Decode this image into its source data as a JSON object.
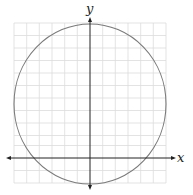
{
  "figure": {
    "type": "coordinate-plane-with-circle",
    "axes": {
      "x_label": "x",
      "y_label": "y",
      "arrows": "both-ends"
    },
    "grid": {
      "visible": true,
      "columns": 12,
      "rows": 13,
      "line_color": "#d9d9d9"
    },
    "circle": {
      "stroke_color": "#7a7a7a",
      "center_units": [
        0,
        4
      ],
      "radius_units": 6
    },
    "colors": {
      "axis": "#222222",
      "background": "#ffffff"
    }
  }
}
